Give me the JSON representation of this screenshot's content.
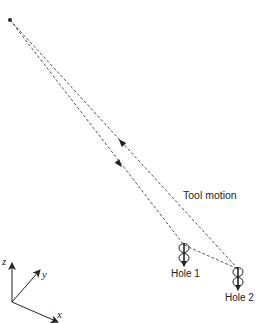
{
  "diagram": {
    "annotation": "Tool motion",
    "holes": [
      {
        "label": "Hole 1",
        "x": 184,
        "y_top": 248,
        "y_bottom": 260
      },
      {
        "label": "Hole 2",
        "x": 238,
        "y_top": 272,
        "y_bottom": 284
      }
    ],
    "start_point": {
      "x": 10,
      "y": 20
    },
    "axes": {
      "origin": {
        "x": 12,
        "y": 302
      },
      "labels": {
        "x": "x",
        "y": "y",
        "z": "z"
      }
    },
    "colors": {
      "line": "#555555",
      "ink": "#222222",
      "background": "#ffffff"
    }
  }
}
